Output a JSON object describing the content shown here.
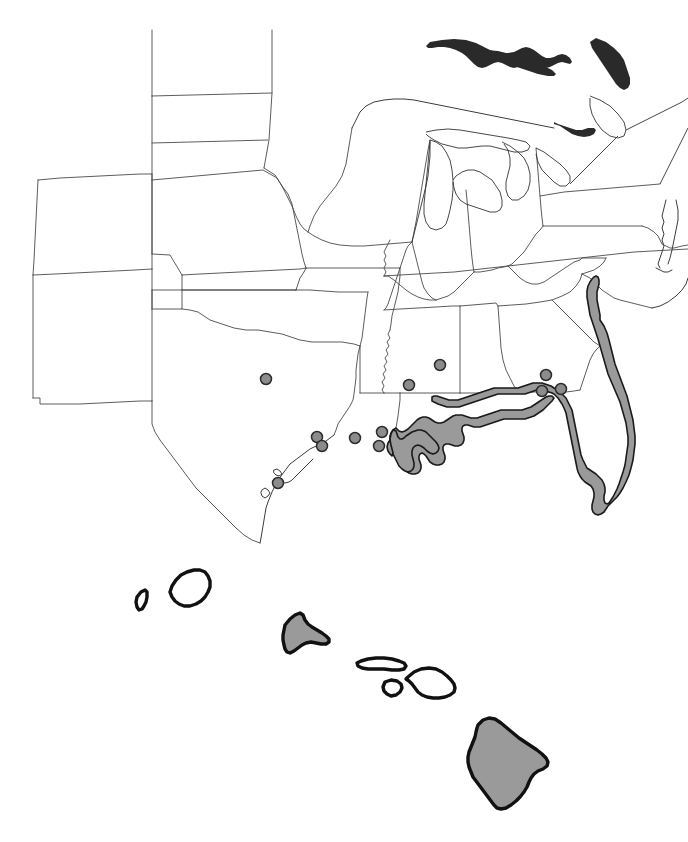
{
  "figure": {
    "name": "distribution-map",
    "type": "range-and-occurrence-map",
    "region": "southeastern-united-states-and-hawaii",
    "width": 688,
    "height": 842,
    "background_color": "#ffffff",
    "has_text_labels": false,
    "has_legend": false,
    "has_scale_bar": false,
    "has_axes": false,
    "has_title": false
  },
  "symbology": {
    "range_fill_color": "#9a9a9a",
    "range_outline_color": "#1a1a1a",
    "state_border_color": "#4a4a4a",
    "coastline_color": "#3c3c3c",
    "island_outline_color": "#111111",
    "unshaded_fill_color": "#ffffff",
    "dot_fill_color": "#8c8c8c",
    "dot_outline_color": "#2b2b2b",
    "dot_radius_px": 5.5
  },
  "panels": [
    {
      "id": "mainland-panel",
      "name": "conterminous-united-states",
      "bounds": {
        "x": 0,
        "y": 0,
        "width": 688,
        "height": 545
      }
    },
    {
      "id": "hawaii-inset",
      "name": "hawaiian-islands-inset",
      "bounds": {
        "x": 100,
        "y": 550,
        "width": 500,
        "height": 292
      }
    }
  ],
  "shaded_range_areas": [
    {
      "name": "louisiana-coastal-zone",
      "shaded": true
    },
    {
      "name": "mississippi-coastal-zone",
      "shaded": true
    },
    {
      "name": "alabama-coastal-zone",
      "shaded": true
    },
    {
      "name": "florida-panhandle-coastal-zone",
      "shaded": true
    },
    {
      "name": "florida-peninsula",
      "shaded": true
    },
    {
      "name": "georgia-coastal-strip",
      "shaded": true
    },
    {
      "name": "south-carolina-coastal-strip",
      "shaded": true
    },
    {
      "name": "oahu",
      "shaded": true
    },
    {
      "name": "hawaii-big-island",
      "shaded": true
    }
  ],
  "unshaded_islands": [
    {
      "name": "niihau",
      "shaded": false
    },
    {
      "name": "kauai",
      "shaded": false
    },
    {
      "name": "molokai",
      "shaded": false
    },
    {
      "name": "lanai",
      "shaded": false
    },
    {
      "name": "maui",
      "shaded": false
    }
  ],
  "occurrence_points": [
    {
      "id": 1,
      "name": "point-east-texas-inland",
      "x": 266,
      "y": 379
    },
    {
      "id": 2,
      "name": "point-texas-upper-coast-a",
      "x": 317,
      "y": 437
    },
    {
      "id": 3,
      "name": "point-texas-upper-coast-b",
      "x": 322,
      "y": 446
    },
    {
      "id": 4,
      "name": "point-texas-central-coast",
      "x": 278,
      "y": 483
    },
    {
      "id": 5,
      "name": "point-louisiana-southwest-coast",
      "x": 355,
      "y": 438
    },
    {
      "id": 6,
      "name": "point-louisiana-south-central-coast",
      "x": 382,
      "y": 432
    },
    {
      "id": 7,
      "name": "point-louisiana-southeast-coast",
      "x": 379,
      "y": 446
    },
    {
      "id": 8,
      "name": "point-louisiana-mississippi-border",
      "x": 409,
      "y": 385
    },
    {
      "id": 9,
      "name": "point-central-mississippi",
      "x": 440,
      "y": 365
    },
    {
      "id": 10,
      "name": "point-southeast-georgia-north",
      "x": 546,
      "y": 375
    },
    {
      "id": 11,
      "name": "point-southeast-georgia-southwest",
      "x": 542,
      "y": 391
    },
    {
      "id": 12,
      "name": "point-southeast-georgia-southeast",
      "x": 561,
      "y": 389
    }
  ],
  "counts": {
    "occurrence_points_total": 12,
    "shaded_range_areas_total": 9,
    "unshaded_islands_total": 5
  },
  "chart_data": {
    "type": "map",
    "title": "",
    "xlabel": "",
    "ylabel": "",
    "series": [
      {
        "name": "shaded range polygons",
        "values": [
          "louisiana-coastal-zone",
          "mississippi-coastal-zone",
          "alabama-coastal-zone",
          "florida-panhandle-coastal-zone",
          "florida-peninsula",
          "georgia-coastal-strip",
          "south-carolina-coastal-strip",
          "oahu",
          "hawaii-big-island"
        ]
      },
      {
        "name": "occurrence point records",
        "values": [
          12
        ]
      }
    ],
    "legend_position": "none",
    "grid": false
  }
}
